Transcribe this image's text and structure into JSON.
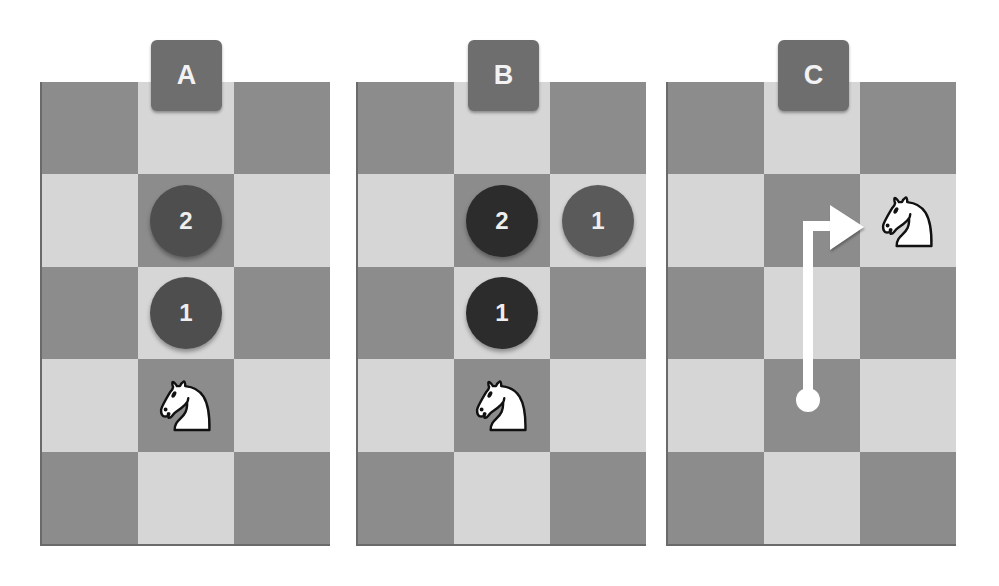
{
  "colors": {
    "dark_square": "#8c8c8c",
    "light_square": "#d6d6d6",
    "label_tile": "#6e6e6e",
    "marker_dark": "#2c2c2c",
    "marker_medium": "#4e4e4e",
    "marker_gray": "#5a5a5a",
    "arrow": "#ffffff"
  },
  "board": {
    "columns": 3,
    "rows": 5
  },
  "panels": [
    {
      "label": "A",
      "markers": [
        {
          "text": "2",
          "row": 2,
          "col": 2,
          "shade": "medium"
        },
        {
          "text": "1",
          "row": 3,
          "col": 2,
          "shade": "medium"
        }
      ],
      "knight": {
        "row": 4,
        "col": 2
      }
    },
    {
      "label": "B",
      "markers": [
        {
          "text": "2",
          "row": 2,
          "col": 2,
          "shade": "dark"
        },
        {
          "text": "1",
          "row": 2,
          "col": 3,
          "shade": "gray"
        },
        {
          "text": "1",
          "row": 3,
          "col": 2,
          "shade": "dark"
        }
      ],
      "knight": {
        "row": 4,
        "col": 2
      }
    },
    {
      "label": "C",
      "markers": [],
      "knight": {
        "row": 2,
        "col": 3
      },
      "move_path": {
        "from": {
          "row": 4,
          "col": 2
        },
        "via": {
          "row": 2,
          "col": 2
        },
        "to": {
          "row": 2,
          "col": 3
        }
      }
    }
  ],
  "icons": {
    "knight": "white-knight-icon",
    "arrow": "move-arrow-icon"
  }
}
